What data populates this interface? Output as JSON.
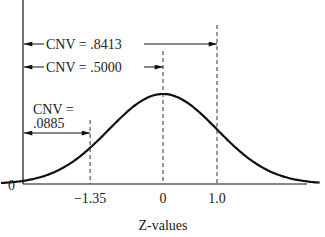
{
  "figure": {
    "type": "normal-distribution-cumulative-diagram",
    "x_axis_label": "Z-values",
    "y_axis_zero_label": "0",
    "z_ticks": [
      {
        "label": "−1.35",
        "z": -1.35
      },
      {
        "label": "0",
        "z": 0
      },
      {
        "label": "1.0",
        "z": 1.0
      }
    ],
    "annotations": [
      {
        "id": "cnv-8413",
        "line1": "CNV = .8413",
        "z_end": 1.0,
        "value": 0.8413
      },
      {
        "id": "cnv-5000",
        "line1": "CNV = .5000",
        "z_end": 0,
        "value": 0.5
      },
      {
        "id": "cnv-0885",
        "line1": "CNV =",
        "line2": ".0885",
        "z_end": -1.35,
        "value": 0.0885
      }
    ],
    "z_range": [
      -3.0,
      2.9
    ]
  }
}
